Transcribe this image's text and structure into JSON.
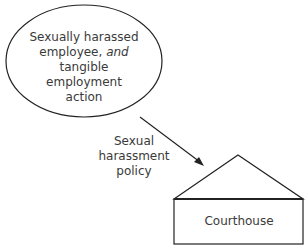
{
  "diagram": {
    "ellipse": {
      "line1": "Sexually harassed",
      "line2_pre": "employee, ",
      "line2_em": "and",
      "line3": "tangible employment",
      "line4": "action"
    },
    "arrow": {
      "label_line1": "Sexual",
      "label_line2": "harassment policy"
    },
    "building": {
      "label": "Courthouse"
    }
  }
}
